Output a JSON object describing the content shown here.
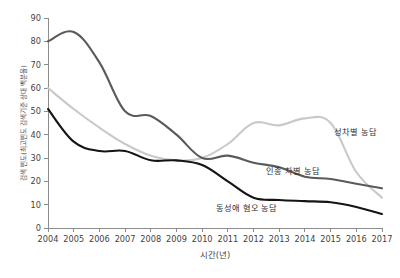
{
  "chart_data": {
    "type": "line",
    "title": "",
    "subtitle": "",
    "xlabel": "시간(년)",
    "ylabel": "검색 빈도(최고빈도 검색기준 상대 백분율)",
    "x": [
      2004,
      2005,
      2006,
      2007,
      2008,
      2009,
      2010,
      2011,
      2012,
      2013,
      2014,
      2015,
      2016,
      2017
    ],
    "xtick_labels": [
      "2004",
      "2005",
      "2006",
      "2007",
      "2008",
      "2009",
      "2010",
      "2011",
      "2012",
      "2013",
      "2014",
      "2015",
      "2016",
      "2017"
    ],
    "ytick_labels": [
      "0",
      "10",
      "20",
      "30",
      "40",
      "50",
      "60",
      "70",
      "80",
      "90"
    ],
    "yticks": [
      0,
      10,
      20,
      30,
      40,
      50,
      60,
      70,
      80,
      90
    ],
    "xlim": [
      2004,
      2017
    ],
    "ylim": [
      0,
      90
    ],
    "grid": false,
    "legend_position": "inline-right",
    "series": [
      {
        "name": "성차별 농담",
        "color": "#c9c9c9",
        "label_x": 2015.15,
        "label_y": 40,
        "values": [
          60,
          51,
          43,
          36,
          31,
          29,
          30,
          36,
          45,
          44,
          47,
          45,
          24,
          13
        ]
      },
      {
        "name": "인종 차별 농담",
        "color": "#5a5a5a",
        "label_x": 2012.5,
        "label_y": 23,
        "values": [
          80,
          84,
          71,
          50,
          48,
          40,
          30,
          31,
          28,
          26,
          22,
          21,
          19,
          17
        ]
      },
      {
        "name": "동성애 혐오 농담",
        "color": "#141414",
        "label_x": 2010.55,
        "label_y": 7.5,
        "values": [
          51,
          37,
          33,
          33,
          29,
          29,
          27,
          20,
          13,
          12,
          11.5,
          11,
          9,
          6
        ]
      }
    ]
  }
}
